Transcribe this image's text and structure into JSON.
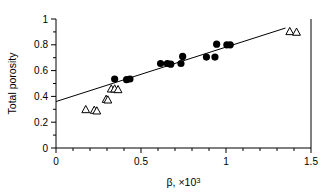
{
  "chart_data": {
    "type": "scatter",
    "title": "",
    "xlabel": "β, ×10³",
    "ylabel": "Total porosity",
    "xlim": [
      0,
      1.5
    ],
    "ylim": [
      0,
      1
    ],
    "grid": false,
    "legend": "none",
    "xticks": [
      0,
      0.5,
      1,
      1.5
    ],
    "xtick_labels": [
      "0",
      "0.5",
      "1",
      "1.5"
    ],
    "xminor_step": 0.1,
    "yticks": [
      0,
      0.2,
      0.4,
      0.6,
      0.8,
      1
    ],
    "ytick_labels": [
      "0",
      "0.2",
      "0.4",
      "0.6",
      "0.8",
      "1"
    ],
    "yminor_step": 0.1,
    "series": [
      {
        "name": "open-triangles",
        "marker": "triangle-open",
        "color": "#000000",
        "points": [
          {
            "x": 0.175,
            "y": 0.295
          },
          {
            "x": 0.225,
            "y": 0.29
          },
          {
            "x": 0.24,
            "y": 0.285
          },
          {
            "x": 0.295,
            "y": 0.375
          },
          {
            "x": 0.305,
            "y": 0.37
          },
          {
            "x": 0.325,
            "y": 0.455
          },
          {
            "x": 0.345,
            "y": 0.455
          },
          {
            "x": 0.365,
            "y": 0.45
          },
          {
            "x": 1.375,
            "y": 0.9
          },
          {
            "x": 1.415,
            "y": 0.895
          }
        ]
      },
      {
        "name": "filled-circles",
        "marker": "circle-filled",
        "color": "#000000",
        "points": [
          {
            "x": 0.345,
            "y": 0.535
          },
          {
            "x": 0.415,
            "y": 0.53
          },
          {
            "x": 0.435,
            "y": 0.535
          },
          {
            "x": 0.615,
            "y": 0.655
          },
          {
            "x": 0.655,
            "y": 0.655
          },
          {
            "x": 0.675,
            "y": 0.65
          },
          {
            "x": 0.735,
            "y": 0.655
          },
          {
            "x": 0.745,
            "y": 0.71
          },
          {
            "x": 0.885,
            "y": 0.705
          },
          {
            "x": 0.935,
            "y": 0.705
          },
          {
            "x": 0.945,
            "y": 0.805
          },
          {
            "x": 1.005,
            "y": 0.8
          },
          {
            "x": 1.025,
            "y": 0.8
          }
        ]
      }
    ],
    "fit_line": {
      "name": "regression-line",
      "x_start": 0.0,
      "y_start": 0.36,
      "x_end": 1.35,
      "y_end": 0.93,
      "color": "#000000"
    }
  }
}
